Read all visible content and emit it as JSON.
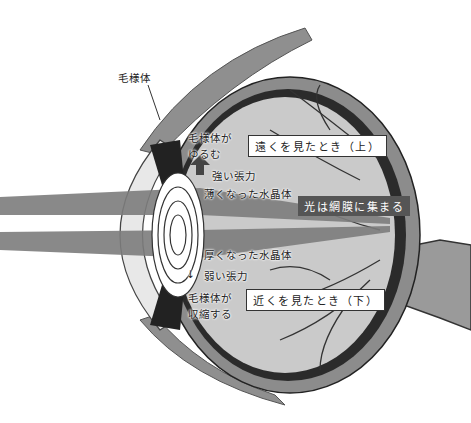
{
  "labels": {
    "ciliary_body": "毛様体",
    "ciliary_relaxes_line1": "毛様体が",
    "ciliary_relaxes_line2": "ゆるむ",
    "strong_tension": "強い張力",
    "thin_lens": "薄くなった水晶体",
    "light_retina": "光は網膜に集まる",
    "thick_lens": "厚くなった水晶体",
    "weak_tension": "弱い張力",
    "ciliary_contracts_line1": "毛様体が",
    "ciliary_contracts_line2": "収縮する",
    "far_view": "遠くを見たとき（上）",
    "near_view": "近くを見たとき（下）"
  },
  "arrows": {
    "up": "⇧",
    "down": "↓"
  },
  "colors": {
    "sclera": "#8a8a8a",
    "choroid": "#2a2a2a",
    "vitreous": "#c9c9c9",
    "cornea": "#e6e6e6",
    "light_beam": "#7d7d7d",
    "retina_label_bg": "#555555",
    "muscle": "#909090"
  }
}
